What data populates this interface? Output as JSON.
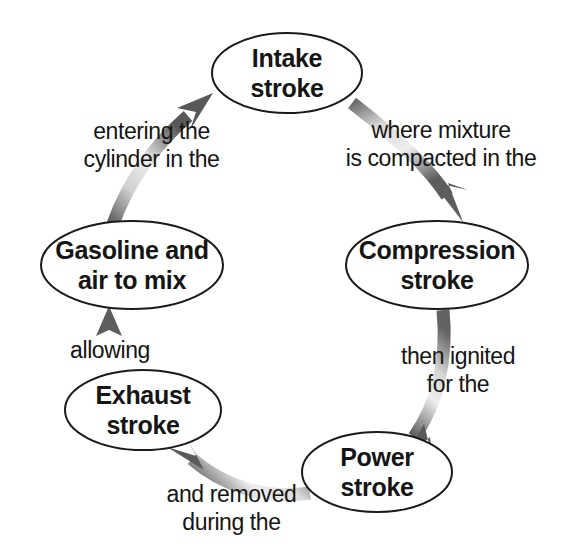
{
  "diagram": {
    "type": "cycle-diagram",
    "background_color": "#ffffff",
    "text_color": "#151515",
    "ellipse_fill": "#ffffff",
    "ellipse_stroke": "#1a1a1a",
    "arrow_color_dark": "#5a5a5a",
    "arrow_color_light": "#e8e8e8"
  },
  "nodes": [
    {
      "id": "intake",
      "label": "Intake\nstroke",
      "cx": 287,
      "cy": 73,
      "rx": 75,
      "ry": 40
    },
    {
      "id": "compression",
      "label": "Compression\nstroke",
      "cx": 437,
      "cy": 265,
      "rx": 91,
      "ry": 44
    },
    {
      "id": "power",
      "label": "Power\nstroke",
      "cx": 377,
      "cy": 472,
      "rx": 75,
      "ry": 40
    },
    {
      "id": "exhaust",
      "label": "Exhaust\nstroke",
      "cx": 143,
      "cy": 410,
      "rx": 78,
      "ry": 40
    },
    {
      "id": "gasoline",
      "label": "Gasoline and\nair to mix",
      "cx": 132,
      "cy": 265,
      "rx": 91,
      "ry": 44
    }
  ],
  "edges": [
    {
      "id": "intake-to-compression",
      "from": "intake",
      "to": "compression",
      "label": "where mixture\nis compacted in the",
      "label_x": 441,
      "label_y": 117,
      "label_width": 210
    },
    {
      "id": "compression-to-power",
      "from": "compression",
      "to": "power",
      "label": "then ignited\nfor the",
      "label_x": 458,
      "label_y": 343,
      "label_width": 150
    },
    {
      "id": "power-to-exhaust",
      "from": "power",
      "to": "exhaust",
      "label": "and removed\nduring the",
      "label_x": 231,
      "label_y": 481,
      "label_width": 175
    },
    {
      "id": "exhaust-to-gasoline",
      "from": "exhaust",
      "to": "gasoline",
      "label": "allowing",
      "label_x": 110,
      "label_y": 337,
      "label_width": 120
    },
    {
      "id": "gasoline-to-intake",
      "from": "gasoline",
      "to": "intake",
      "label": "entering the\ncylinder in the",
      "label_x": 151,
      "label_y": 118,
      "label_width": 175
    }
  ]
}
